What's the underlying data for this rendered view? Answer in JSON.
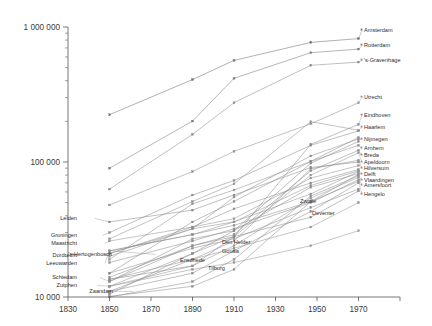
{
  "chart_data": {
    "type": "line",
    "title": "",
    "xlabel": "",
    "ylabel": "",
    "yscale": "log",
    "xlim": [
      1830,
      1990
    ],
    "ylim": [
      10000,
      1000000
    ],
    "grid": false,
    "legend_position": "inline-right",
    "x_ticks": [
      1830,
      1850,
      1870,
      1890,
      1910,
      1930,
      1950,
      1970
    ],
    "x_tick_labels": [
      "1830",
      "1850",
      "1870",
      "1890",
      "1910",
      "1930",
      "1950",
      "1970"
    ],
    "y_ticks": [
      10000,
      100000,
      1000000
    ],
    "y_tick_labels": [
      "10 000",
      "100 000",
      "1 000 000"
    ],
    "x": [
      1850,
      1890,
      1910,
      1947,
      1970
    ],
    "series": [
      {
        "name": "Amsterdam",
        "values": [
          224000,
          408000,
          566000,
          769000,
          820000
        ],
        "label_y": 32,
        "color": "#6f6f6f"
      },
      {
        "name": "Rotterdam",
        "values": [
          90000,
          201000,
          417000,
          645000,
          686000
        ],
        "label_y": 47,
        "color": "#7a7a7a"
      },
      {
        "name": "'s-Gravenhage",
        "values": [
          63000,
          160000,
          275000,
          520000,
          550000
        ],
        "label_y": 62,
        "color": "#8c8c8c"
      },
      {
        "name": "Utrecht",
        "values": [
          48000,
          85000,
          120000,
          192000,
          275000
        ],
        "label_y": 99,
        "color": "#8f8f8f"
      },
      {
        "name": "Eindhoven",
        "values": [
          13500,
          17000,
          28000,
          135000,
          190000
        ],
        "label_y": 117,
        "color": "#8a8a8a"
      },
      {
        "name": "Haarlem",
        "values": [
          27000,
          51000,
          69000,
          199000,
          172000
        ],
        "label_y": 129,
        "color": "#909090"
      },
      {
        "name": "Nijmegen",
        "values": [
          21000,
          32000,
          55000,
          111000,
          148000
        ],
        "label_y": 141,
        "color": "#8d8d8d"
      },
      {
        "name": "Arnhem",
        "values": [
          19000,
          49000,
          62000,
          101000,
          133000
        ],
        "label_y": 150,
        "color": "#909090"
      },
      {
        "name": "Breda",
        "values": [
          14000,
          24000,
          29000,
          86000,
          122000
        ],
        "label_y": 157,
        "color": "#8b8b8b"
      },
      {
        "name": "Apeldoorn",
        "values": [
          12000,
          21000,
          28000,
          80000,
          117000
        ],
        "label_y": 164,
        "color": "#949494"
      },
      {
        "name": "Hilversum",
        "values": [
          11000,
          19000,
          26000,
          89000,
          103000
        ],
        "label_y": 170,
        "color": "#8e8e8e"
      },
      {
        "name": "Delft",
        "values": [
          20000,
          32000,
          36000,
          67000,
          86000
        ],
        "label_y": 176,
        "color": "#929292"
      },
      {
        "name": "Vlaardingen",
        "values": [
          10000,
          13000,
          19000,
          56000,
          79000
        ],
        "label_y": 182,
        "color": "#8d8d8d"
      },
      {
        "name": "Amersfoort",
        "values": [
          12000,
          17000,
          24000,
          54000,
          77000
        ],
        "label_y": 187,
        "color": "#969696"
      },
      {
        "name": "Hengelo",
        "values": [
          10100,
          12000,
          16000,
          51000,
          72000
        ],
        "label_y": 196,
        "color": "#8f8f8f"
      },
      {
        "name": "Zwolle",
        "values": [
          18000,
          26000,
          32000,
          50000,
          74000
        ],
        "label_y": 203,
        "color": "#8c8c8c",
        "label_x": 300
      },
      {
        "name": "Deventer",
        "values": [
          15000,
          23000,
          27000,
          46000,
          63000
        ],
        "label_y": 215,
        "color": "#909090",
        "label_x": 312
      },
      {
        "name": "Leiden",
        "values": [
          36000,
          44000,
          57000,
          91000,
          100000
        ],
        "label_y": 220,
        "color": "#898989",
        "side": "left",
        "label_x": 77
      },
      {
        "name": "Groningen",
        "values": [
          30000,
          57000,
          73000,
          133000,
          170000
        ],
        "label_y": 237,
        "color": "#8b8b8b",
        "side": "left",
        "label_x": 77
      },
      {
        "name": "Maastricht",
        "values": [
          26000,
          33000,
          38000,
          76000,
          94000
        ],
        "label_y": 245,
        "color": "#949494",
        "side": "left",
        "label_x": 77
      },
      {
        "name": "Dordrecht",
        "values": [
          21000,
          33000,
          45000,
          70000,
          88000
        ],
        "label_y": 257,
        "color": "#8e8e8e",
        "side": "left",
        "label_x": 77
      },
      {
        "name": "Leeuwarden",
        "values": [
          22000,
          29000,
          36000,
          58000,
          85000
        ],
        "label_y": 265,
        "color": "#919191",
        "side": "left",
        "label_x": 77
      },
      {
        "name": "'s-Hertogenbosch",
        "values": [
          22000,
          29000,
          34000,
          51000,
          81000
        ],
        "label_y": 256,
        "color": "#8d8d8d",
        "side": "left",
        "label_x": 112
      },
      {
        "name": "Schiedam",
        "values": [
          13000,
          27000,
          31000,
          65000,
          82000
        ],
        "label_y": 279,
        "color": "#8f8f8f",
        "side": "left",
        "label_x": 77
      },
      {
        "name": "Zutphen",
        "values": [
          12000,
          16000,
          18000,
          24000,
          31000
        ],
        "label_y": 287,
        "color": "#959595",
        "side": "left",
        "label_x": 77
      },
      {
        "name": "Zaandam",
        "values": [
          11000,
          15000,
          22000,
          43000,
          70000
        ],
        "label_y": 293,
        "color": "#8e8e8e",
        "side": "left",
        "label_x": 113
      },
      {
        "name": "Den Helder",
        "values": [
          13000,
          24000,
          28000,
          39000,
          61000
        ],
        "label_y": 244,
        "color": "#8c8c8c",
        "label_x": 222
      },
      {
        "name": "Gouda",
        "values": [
          13500,
          19000,
          23000,
          33000,
          50000
        ],
        "label_y": 253,
        "color": "#929292",
        "label_x": 222
      },
      {
        "name": "Enschede",
        "values": [
          10500,
          21000,
          31000,
          98000,
          142000
        ],
        "label_y": 262,
        "color": "#8a8a8a",
        "label_x": 180
      },
      {
        "name": "Tilburg",
        "values": [
          15000,
          36000,
          51000,
          101000,
          152000
        ],
        "label_y": 270,
        "color": "#8e8e8e",
        "label_x": 208
      }
    ]
  }
}
